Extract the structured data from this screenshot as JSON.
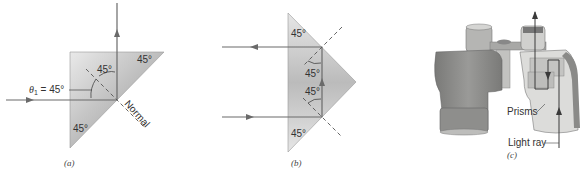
{
  "figure": {
    "panels": [
      {
        "id": "a",
        "caption": "(a)",
        "labels": {
          "top_angle": "45°",
          "bottom_angle": "45°",
          "incidence_angle": "45°",
          "theta_label": "θ",
          "theta_sub": "1",
          "theta_value": " = 45°",
          "normal": "Normal"
        }
      },
      {
        "id": "b",
        "caption": "(b)",
        "labels": {
          "top_angle": "45°",
          "upper_inner_angle": "45°",
          "lower_inner_angle": "45°",
          "bottom_angle": "45°"
        }
      },
      {
        "id": "c",
        "caption": "(c)",
        "labels": {
          "prisms": "Prisms",
          "light_ray": "Light ray"
        }
      }
    ],
    "colors": {
      "prism_fill_light": "#e6e6e6",
      "prism_fill_dark": "#b9b9b9",
      "ray": "#6a6a6a",
      "binocular_body": "#8a8a88",
      "binocular_light": "#cfcfcd"
    }
  }
}
